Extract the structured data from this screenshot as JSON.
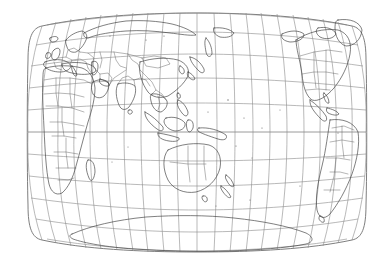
{
  "figure": {
    "kind": "world-map",
    "title": "World Map",
    "projection_name": "Van der Grinten style elliptical world projection",
    "background_color": "#ffffff",
    "border_color": "#6f6f6f",
    "graticule_color": "#8a8a8a",
    "coastline_color": "#3b3b3b",
    "boundary_color": "#5c5c5c"
  },
  "graticule": {
    "meridian_interval_degrees": 15,
    "parallel_interval_degrees": 15,
    "central_meridian_degrees": 150,
    "meridian_count": 23,
    "parallel_count": 11,
    "latitude_range": [
      -90,
      90
    ],
    "longitude_range": [
      -180,
      180
    ],
    "equator_label": "0",
    "parallels_degrees": [
      75,
      60,
      45,
      30,
      15,
      0,
      -15,
      -30,
      -45,
      -60,
      -75
    ],
    "meridians_degrees": [
      -180,
      -165,
      -150,
      -135,
      -120,
      -105,
      -90,
      -75,
      -60,
      -45,
      -30,
      -15,
      0,
      15,
      30,
      45,
      60,
      75,
      90,
      105,
      120,
      135,
      150,
      165,
      180
    ]
  },
  "map_extent": {
    "left_px": 28,
    "right_px": 366,
    "top_px": 13,
    "bottom_px": 251,
    "center_x_px": 197,
    "equator_y_px": 132
  },
  "landmasses": [
    {
      "name": "Eurasia",
      "position": "upper-left to upper-center"
    },
    {
      "name": "Africa",
      "position": "left-center"
    },
    {
      "name": "Australia",
      "position": "center-lower"
    },
    {
      "name": "Southeast Asia and Indonesia",
      "position": "center"
    },
    {
      "name": "North America",
      "position": "right-upper"
    },
    {
      "name": "South America",
      "position": "right-lower"
    },
    {
      "name": "Antarctica",
      "position": "bottom"
    },
    {
      "name": "Greenland",
      "position": "top-right"
    },
    {
      "name": "Japan",
      "position": "upper-center"
    },
    {
      "name": "New Zealand",
      "position": "center-lower-right"
    }
  ],
  "features": {
    "has_coastlines": true,
    "has_political_boundaries": true,
    "has_graticule": true,
    "has_labels": false,
    "has_legend": false,
    "style": "grayscale line drawing"
  }
}
